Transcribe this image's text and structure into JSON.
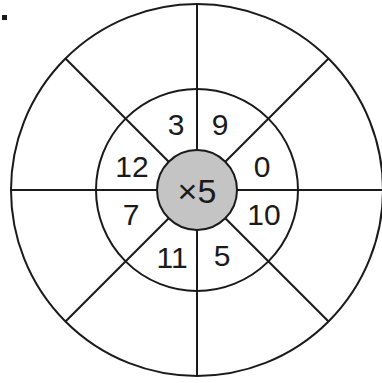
{
  "diagram": {
    "type": "multiplication-wheel",
    "center": {
      "operator": "×",
      "multiplier": "5",
      "label": "×5"
    },
    "inner_ring_numbers": [
      {
        "position": "top-left",
        "value": "3"
      },
      {
        "position": "top-right",
        "value": "9"
      },
      {
        "position": "right-upper",
        "value": "0"
      },
      {
        "position": "right-lower",
        "value": "10"
      },
      {
        "position": "bottom-right",
        "value": "5"
      },
      {
        "position": "bottom-left",
        "value": "11"
      },
      {
        "position": "left-lower",
        "value": "7"
      },
      {
        "position": "left-upper",
        "value": "12"
      }
    ],
    "outer_ring_answers": [
      "",
      "",
      "",
      "",
      "",
      "",
      "",
      ""
    ],
    "colors": {
      "line": "#1a1a1a",
      "center_fill": "#c4c4c4",
      "background": "#ffffff"
    }
  }
}
